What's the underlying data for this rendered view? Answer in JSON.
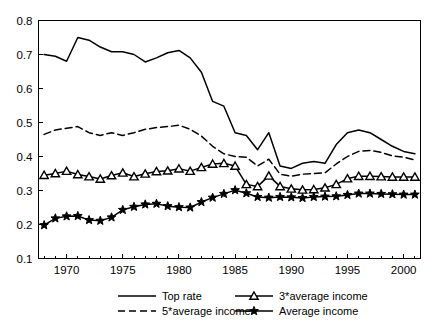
{
  "chart_data": {
    "type": "line",
    "title": "",
    "subtitle": "",
    "xlabel": "",
    "ylabel": "",
    "xlim": [
      1967.5,
      2001.5
    ],
    "ylim": [
      0.1,
      0.8
    ],
    "grid": false,
    "legend_position": "bottom",
    "x_tick_labels": [
      "1970",
      "1975",
      "1980",
      "1985",
      "1990",
      "1995",
      "2000"
    ],
    "x_ticks": [
      1970,
      1975,
      1980,
      1985,
      1990,
      1995,
      2000
    ],
    "y_tick_labels": [
      "0.1",
      "0.2",
      "0.3",
      "0.4",
      "0.5",
      "0.6",
      "0.7",
      "0.8"
    ],
    "y_ticks": [
      0.1,
      0.2,
      0.3,
      0.4,
      0.5,
      0.6,
      0.7,
      0.8
    ],
    "x": [
      1968,
      1969,
      1970,
      1971,
      1972,
      1973,
      1974,
      1975,
      1976,
      1977,
      1978,
      1979,
      1980,
      1981,
      1982,
      1983,
      1984,
      1985,
      1986,
      1987,
      1988,
      1989,
      1990,
      1991,
      1992,
      1993,
      1994,
      1995,
      1996,
      1997,
      1998,
      1999,
      2000,
      2001
    ],
    "series": [
      {
        "name": "Top rate",
        "style": "solid",
        "marker": "none",
        "values": [
          0.7,
          0.695,
          0.68,
          0.75,
          0.742,
          0.722,
          0.708,
          0.708,
          0.7,
          0.678,
          0.69,
          0.705,
          0.712,
          0.69,
          0.648,
          0.562,
          0.548,
          0.47,
          0.462,
          0.42,
          0.47,
          0.372,
          0.365,
          0.38,
          0.385,
          0.38,
          0.435,
          0.47,
          0.478,
          0.47,
          0.45,
          0.43,
          0.415,
          0.408
        ]
      },
      {
        "name": "5*average income",
        "style": "dashed",
        "marker": "none",
        "values": [
          0.465,
          0.478,
          0.483,
          0.488,
          0.47,
          0.462,
          0.47,
          0.462,
          0.47,
          0.48,
          0.485,
          0.488,
          0.492,
          0.48,
          0.46,
          0.43,
          0.408,
          0.4,
          0.398,
          0.372,
          0.392,
          0.348,
          0.342,
          0.348,
          0.35,
          0.352,
          0.378,
          0.4,
          0.415,
          0.418,
          0.412,
          0.402,
          0.398,
          0.39
        ]
      },
      {
        "name": "3*average income",
        "style": "solid",
        "marker": "triangle",
        "values": [
          0.345,
          0.35,
          0.357,
          0.347,
          0.341,
          0.334,
          0.344,
          0.352,
          0.341,
          0.349,
          0.356,
          0.358,
          0.364,
          0.357,
          0.368,
          0.378,
          0.38,
          0.372,
          0.318,
          0.312,
          0.343,
          0.312,
          0.305,
          0.302,
          0.303,
          0.308,
          0.318,
          0.335,
          0.342,
          0.342,
          0.341,
          0.34,
          0.34,
          0.34
        ]
      },
      {
        "name": "Average income",
        "style": "solid",
        "marker": "star",
        "values": [
          0.198,
          0.218,
          0.224,
          0.225,
          0.213,
          0.211,
          0.221,
          0.243,
          0.252,
          0.259,
          0.261,
          0.254,
          0.251,
          0.25,
          0.266,
          0.279,
          0.29,
          0.301,
          0.292,
          0.281,
          0.279,
          0.281,
          0.28,
          0.278,
          0.281,
          0.282,
          0.283,
          0.287,
          0.291,
          0.291,
          0.29,
          0.289,
          0.288,
          0.288
        ]
      }
    ]
  },
  "legend": {
    "entries": [
      {
        "label": "Top rate",
        "style": "solid",
        "marker": "none"
      },
      {
        "label": "3*average income",
        "style": "solid",
        "marker": "triangle"
      },
      {
        "label": "5*average income",
        "style": "dashed",
        "marker": "none"
      },
      {
        "label": "Average income",
        "style": "solid",
        "marker": "star"
      }
    ]
  },
  "colors": {
    "line": "#000000",
    "axis": "#000000",
    "background": "#ffffff"
  }
}
